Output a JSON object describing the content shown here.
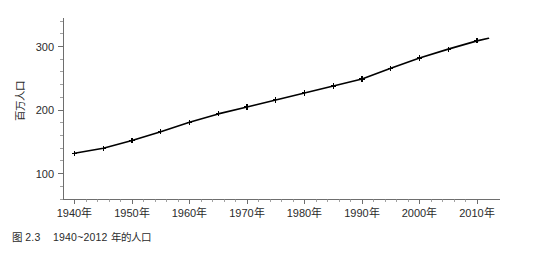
{
  "caption": {
    "text": "图 2.3    1940~2012 年的人口"
  },
  "chart_data": {
    "type": "line",
    "title": "",
    "xlabel": "",
    "ylabel": "百万人口",
    "xlim": [
      1938,
      2014
    ],
    "ylim": [
      60,
      345
    ],
    "grid": false,
    "legend": "none",
    "x_tick_labels": [
      "1940年",
      "1950年",
      "1960年",
      "1970年",
      "1980年",
      "1990年",
      "2000年",
      "2010年"
    ],
    "x_tick_values": [
      1940,
      1950,
      1960,
      1970,
      1980,
      1990,
      2000,
      2010
    ],
    "x_minor_step": 2,
    "y_tick_labels": [
      "100",
      "200",
      "300"
    ],
    "y_tick_values": [
      100,
      200,
      300
    ],
    "y_minor_step": 20,
    "marker": "plus",
    "line_color": "#000000",
    "series": [
      {
        "name": "人口",
        "x": [
          1940,
          1945,
          1950,
          1955,
          1960,
          1965,
          1970,
          1975,
          1980,
          1985,
          1990,
          1995,
          2000,
          2005,
          2010,
          2012
        ],
        "values": [
          132,
          140,
          152,
          166,
          181,
          194,
          205,
          216,
          227,
          238,
          249,
          266,
          282,
          296,
          309,
          313
        ]
      }
    ]
  }
}
